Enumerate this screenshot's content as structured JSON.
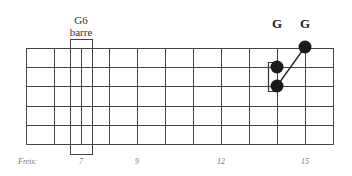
{
  "barre_label": {
    "line1": "G6",
    "line2": "barre"
  },
  "note_labels": [
    {
      "text": "G",
      "fret": 14
    },
    {
      "text": "G",
      "fret": 15
    }
  ],
  "frets_label": "Frets:",
  "fret_numbers": [
    {
      "text": "7",
      "fret": 7
    },
    {
      "text": "9",
      "fret": 9
    },
    {
      "text": "12",
      "fret": 12
    },
    {
      "text": "15",
      "fret": 15
    }
  ],
  "fretboard": {
    "strings": 6,
    "fret_lines_visible": 12,
    "first_line_fret": 5,
    "line_color": "#444444"
  },
  "barre": {
    "fret": 7,
    "from_string": 1,
    "to_string": 6
  },
  "dots": [
    {
      "fret": 15,
      "string": 1,
      "color": "#1a1a1a"
    },
    {
      "fret": 14,
      "string": 2,
      "color": "#1a1a1a"
    },
    {
      "fret": 14,
      "string": 3,
      "color": "#1a1a1a"
    }
  ],
  "connector": {
    "from": {
      "fret": 14,
      "string": 3
    },
    "to": {
      "fret": 15,
      "string": 1
    }
  },
  "bracket": {
    "fret": 14,
    "from_string": 2,
    "to_string": 3
  }
}
